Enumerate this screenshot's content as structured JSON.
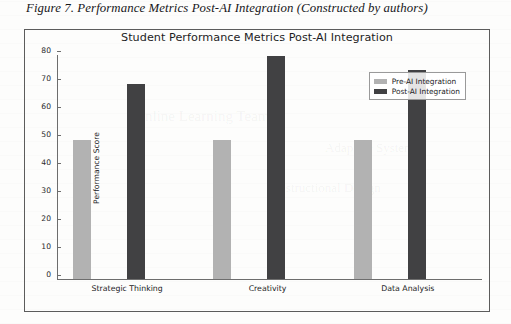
{
  "figure": {
    "caption": "Figure 7. Performance Metrics Post-AI Integration (Constructed by authors)"
  },
  "chart_data": {
    "type": "bar",
    "title": "Student Performance Metrics Post-AI Integration",
    "xlabel": "",
    "ylabel": "Performance Score",
    "categories": [
      "Strategic Thinking",
      "Creativity",
      "Data Analysis"
    ],
    "series": [
      {
        "name": "Pre-AI Integration",
        "color": "#b2b2b2",
        "values": [
          50,
          50,
          50
        ]
      },
      {
        "name": "Post-AI Integration",
        "color": "#414143",
        "values": [
          70,
          80,
          75
        ]
      }
    ],
    "ylim": [
      0,
      80
    ],
    "yticks": [
      0,
      10,
      20,
      30,
      40,
      50,
      60,
      70,
      80
    ],
    "ytick_labels": [
      "0",
      "10",
      "20",
      "30",
      "40",
      "50",
      "60",
      "70",
      "80"
    ],
    "grid": false,
    "legend_position": "upper right"
  },
  "ghost_text": {
    "a": "nline Learning Team",
    "b": "Instructional Design",
    "c": "Adaptive Systems"
  }
}
